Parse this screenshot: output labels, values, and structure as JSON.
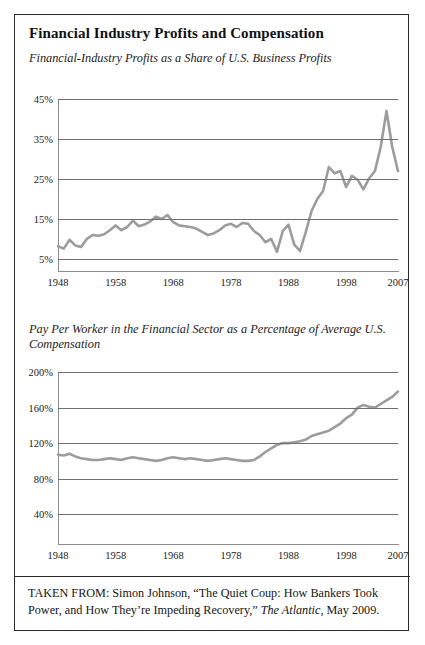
{
  "figure": {
    "title": "Financial Industry Profits and Compensation",
    "source_prefix": "TAKEN FROM: Simon Johnson, “The Quiet Coup: How Bankers Took Power, and How They’re Impeding Recovery,” ",
    "source_publication": "The Atlantic",
    "source_suffix": ", May 2009.",
    "source_full": "TAKEN FROM: Simon Johnson, “The Quiet Coup: How Bankers Took Power, and How They’re Impeding Recovery,” The Atlantic, May 2009.",
    "border_color": "#2b2b2b",
    "line_color": "#9c9c9c",
    "grid_color": "#6f6f6f"
  },
  "chart_data": [
    {
      "type": "line",
      "title": "Financial-Industry Profits as a Share of U.S. Business Profits",
      "xlabel": "",
      "ylabel": "",
      "xlim": [
        1948,
        2007
      ],
      "ylim": [
        5,
        45
      ],
      "grid": true,
      "legend": "none",
      "ytick_labels": [
        "45%",
        "35%",
        "25%",
        "15%",
        "5%"
      ],
      "ytick_values": [
        45,
        35,
        25,
        15,
        5
      ],
      "xtick_labels": [
        "1948",
        "1958",
        "1968",
        "1978",
        "1988",
        "1998",
        "2007"
      ],
      "xtick_values": [
        1948,
        1958,
        1968,
        1978,
        1988,
        1998,
        2007
      ],
      "x": [
        1948,
        1949,
        1950,
        1951,
        1952,
        1953,
        1954,
        1955,
        1956,
        1957,
        1958,
        1959,
        1960,
        1961,
        1962,
        1963,
        1964,
        1965,
        1966,
        1967,
        1968,
        1969,
        1970,
        1971,
        1972,
        1973,
        1974,
        1975,
        1976,
        1977,
        1978,
        1979,
        1980,
        1981,
        1982,
        1983,
        1984,
        1985,
        1986,
        1987,
        1988,
        1989,
        1990,
        1991,
        1992,
        1993,
        1994,
        1995,
        1996,
        1997,
        1998,
        1999,
        2000,
        2001,
        2002,
        2003,
        2004,
        2005,
        2006,
        2007
      ],
      "values": [
        8.2,
        7.6,
        9.8,
        8.4,
        8.0,
        10.0,
        11.0,
        10.8,
        11.2,
        12.2,
        13.4,
        12.2,
        13.0,
        14.6,
        13.2,
        13.6,
        14.4,
        15.6,
        15.0,
        16.0,
        14.2,
        13.4,
        13.2,
        13.0,
        12.6,
        11.8,
        11.0,
        11.4,
        12.2,
        13.4,
        13.8,
        13.0,
        14.0,
        13.8,
        12.0,
        11.0,
        9.2,
        10.0,
        6.8,
        12.0,
        13.6,
        8.6,
        7.0,
        11.8,
        17.0,
        20.0,
        22.0,
        28.0,
        26.4,
        27.0,
        23.0,
        25.8,
        24.8,
        22.4,
        25.2,
        27.0,
        33.0,
        42.0,
        33.0,
        27.0
      ]
    },
    {
      "type": "line",
      "title": "Pay Per Worker in the Financial Sector as a Percentage of Average U.S. Compensation",
      "xlabel": "",
      "ylabel": "",
      "xlim": [
        1948,
        2007
      ],
      "ylim": [
        20,
        200
      ],
      "grid": true,
      "legend": "none",
      "ytick_labels": [
        "200%",
        "160%",
        "120%",
        "80%",
        "40%"
      ],
      "ytick_values": [
        200,
        160,
        120,
        80,
        40
      ],
      "xtick_labels": [
        "1948",
        "1958",
        "1968",
        "1978",
        "1988",
        "1998",
        "2007"
      ],
      "xtick_values": [
        1948,
        1958,
        1968,
        1978,
        1988,
        1998,
        2007
      ],
      "x": [
        1948,
        1949,
        1950,
        1951,
        1952,
        1953,
        1954,
        1955,
        1956,
        1957,
        1958,
        1959,
        1960,
        1961,
        1962,
        1963,
        1964,
        1965,
        1966,
        1967,
        1968,
        1969,
        1970,
        1971,
        1972,
        1973,
        1974,
        1975,
        1976,
        1977,
        1978,
        1979,
        1980,
        1981,
        1982,
        1983,
        1984,
        1985,
        1986,
        1987,
        1988,
        1989,
        1990,
        1991,
        1992,
        1993,
        1994,
        1995,
        1996,
        1997,
        1998,
        1999,
        2000,
        2001,
        2002,
        2003,
        2004,
        2005,
        2006,
        2007
      ],
      "values": [
        107,
        106,
        108,
        105,
        103,
        102,
        101,
        101,
        102,
        103,
        102,
        101,
        103,
        104,
        103,
        102,
        101,
        100,
        101,
        103,
        104,
        103,
        102,
        103,
        102,
        101,
        100,
        101,
        102,
        103,
        102,
        101,
        100,
        100,
        101,
        105,
        110,
        114,
        118,
        120,
        120,
        121,
        122,
        124,
        128,
        130,
        132,
        134,
        138,
        142,
        148,
        152,
        160,
        163,
        161,
        160,
        164,
        168,
        172,
        178
      ]
    }
  ]
}
